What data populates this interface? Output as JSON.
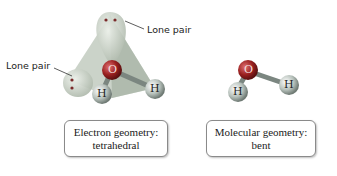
{
  "left_model": {
    "lone_pair_top_label": "Lone pair",
    "lone_pair_left_label": "Lone pair",
    "atoms": {
      "center": "O",
      "h1": "H",
      "h2": "H"
    },
    "caption_line1": "Electron geometry:",
    "caption_line2": "tetrahedral"
  },
  "right_model": {
    "atoms": {
      "center": "O",
      "h1": "H",
      "h2": "H"
    },
    "caption_line1": "Molecular geometry:",
    "caption_line2": "bent"
  },
  "colors": {
    "oxygen": "#b02a2a",
    "hydrogen": "#cfd6d2",
    "lone_pair": "#c9d0c5",
    "tetrahedron": "#a8b5a6"
  }
}
